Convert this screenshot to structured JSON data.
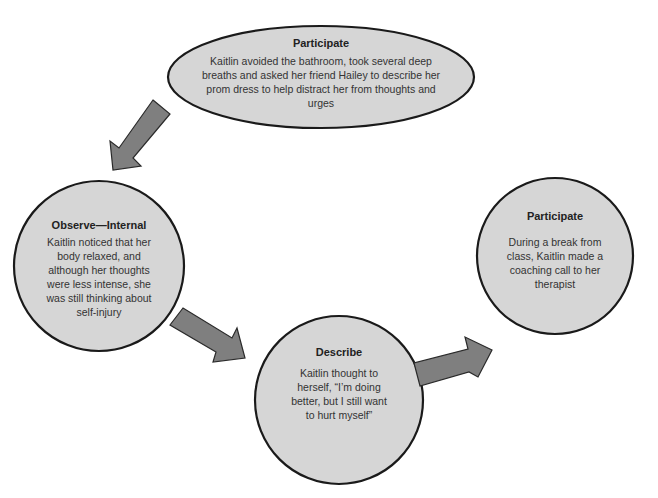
{
  "colors": {
    "node_fill": "#d6d6d6",
    "node_stroke": "#1a1a1a",
    "arrow_fill": "#7f7f7f",
    "arrow_stroke": "#2a2a2a",
    "background": "#ffffff"
  },
  "nodes": [
    {
      "id": "participate-top",
      "shape": "ellipse",
      "title": "Participate",
      "body": "Kaitlin avoided the bathroom, took several deep breaths and asked her friend Hailey to describe her prom dress to help distract her from thoughts and urges"
    },
    {
      "id": "observe-internal",
      "shape": "circle",
      "title": "Observe—Internal",
      "body": "Kaitlin noticed that her body relaxed, and although her thoughts were less intense, she was still thinking about self-injury"
    },
    {
      "id": "describe",
      "shape": "circle",
      "title": "Describe",
      "body": "Kaitlin thought to herself, “I’m doing better, but I still want to hurt myself”"
    },
    {
      "id": "participate-right",
      "shape": "circle",
      "title": "Participate",
      "body": "During a break from class, Kaitlin made a coaching call to her therapist"
    }
  ],
  "edges": [
    {
      "from": "participate-top",
      "to": "observe-internal",
      "icon": "arrow-down-left-icon"
    },
    {
      "from": "observe-internal",
      "to": "describe",
      "icon": "arrow-down-right-icon"
    },
    {
      "from": "describe",
      "to": "participate-right",
      "icon": "arrow-up-right-icon"
    }
  ]
}
